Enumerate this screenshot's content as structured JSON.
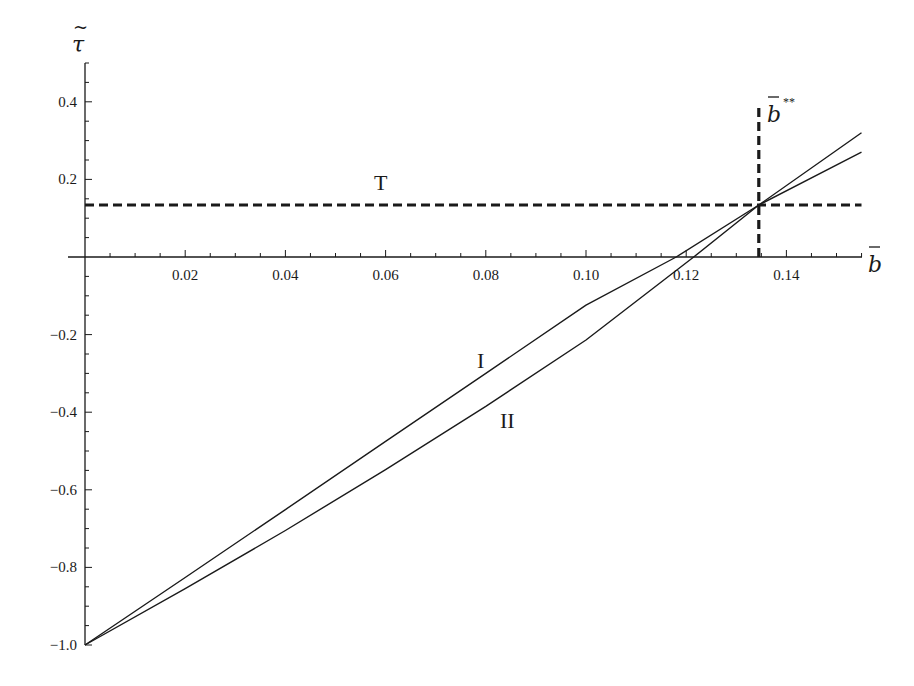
{
  "chart_data": {
    "type": "line",
    "title": "",
    "xlabel": "b̄",
    "ylabel": "τ̃",
    "xlim": [
      0,
      0.155
    ],
    "ylim": [
      -1.0,
      0.5
    ],
    "grid": false,
    "x_ticks": [
      0.02,
      0.04,
      0.06,
      0.08,
      0.1,
      0.12,
      0.14
    ],
    "x_tick_labels": [
      "0.02",
      "0.04",
      "0.06",
      "0.08",
      "0.10",
      "0.12",
      "0.14"
    ],
    "y_ticks": [
      0.4,
      0.2,
      -0.2,
      -0.4,
      -0.6,
      -0.8,
      -1.0
    ],
    "y_tick_labels": [
      "0.4",
      "0.2",
      "−0.2",
      "−0.4",
      "−0.6",
      "−0.8",
      "−1.0"
    ],
    "series": [
      {
        "name": "I",
        "style": "solid",
        "x": [
          0,
          0.02,
          0.04,
          0.06,
          0.08,
          0.1,
          0.118,
          0.1345,
          0.155
        ],
        "values": [
          -1.0,
          -0.826,
          -0.651,
          -0.475,
          -0.3,
          -0.124,
          0.0,
          0.134,
          0.27
        ]
      },
      {
        "name": "II",
        "style": "solid",
        "x": [
          0,
          0.02,
          0.04,
          0.06,
          0.08,
          0.1,
          0.1215,
          0.1345,
          0.155
        ],
        "values": [
          -1.0,
          -0.855,
          -0.705,
          -0.548,
          -0.385,
          -0.214,
          0.0,
          0.134,
          0.32
        ]
      },
      {
        "name": "T",
        "style": "dashed",
        "x": [
          0,
          0.155
        ],
        "values": [
          0.134,
          0.134
        ]
      },
      {
        "name": "b̄**",
        "style": "dashed-vertical",
        "x": [
          0.1345,
          0.1345
        ],
        "values": [
          0.0,
          0.39
        ]
      }
    ],
    "annotations": [
      {
        "text": "T",
        "x": 0.058,
        "y": 0.17
      },
      {
        "text": "I",
        "x": 0.074,
        "y": -0.27
      },
      {
        "text": "II",
        "x": 0.083,
        "y": -0.44
      },
      {
        "text": "b̄**",
        "x": 0.137,
        "y": 0.39
      }
    ]
  },
  "labels": {
    "y_axis_symbol": "τ",
    "x_axis_symbol": "b",
    "bstar_symbol": "b",
    "bstar_superscript": "**",
    "curve_T": "T",
    "curve_I": "I",
    "curve_II": "II"
  },
  "colors": {
    "ink": "#1a1a1a",
    "background": "#ffffff"
  }
}
